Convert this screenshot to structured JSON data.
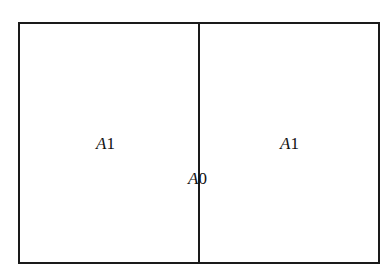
{
  "diagram": {
    "type": "paper-size-division",
    "outer_sheet": {
      "label": "A0"
    },
    "halves": [
      {
        "position": "left",
        "letter": "A",
        "number": "1"
      },
      {
        "position": "right",
        "letter": "A",
        "number": "1"
      }
    ],
    "center": {
      "letter": "A",
      "number": "0"
    },
    "colors": {
      "stroke": "#1a1a1a",
      "background": "#ffffff",
      "text": "#111111"
    }
  }
}
